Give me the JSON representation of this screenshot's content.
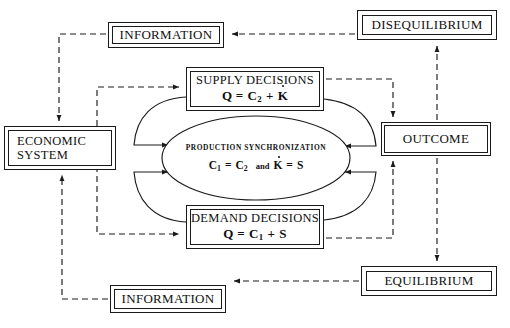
{
  "diagram": {
    "colors": {
      "stroke": "#1a1a1a",
      "text": "#101010",
      "background": "#ffffff"
    },
    "nodes": {
      "information_top": {
        "label": "INFORMATION"
      },
      "disequilibrium": {
        "label": "DISEQUILIBRIUM"
      },
      "economic_system": {
        "label_line1": "ECONOMIC",
        "label_line2": "SYSTEM"
      },
      "supply_decisions": {
        "label": "SUPPLY  DECISIONS",
        "equation_text": "Q = C2 + K̇",
        "equation_lhs": "Q =",
        "equation_c": "C",
        "equation_c_sub": "2",
        "equation_plus": "+",
        "equation_k": "K"
      },
      "demand_decisions": {
        "label": "DEMAND DECISIONS",
        "equation_text": "Q = C1 + S",
        "equation_lhs": "Q =",
        "equation_c": "C",
        "equation_c_sub": "1",
        "equation_plus": "+",
        "equation_s": "S"
      },
      "production_synchronization": {
        "title": "PRODUCTION  SYNCHRONIZATION",
        "equation_text": "C1 = C2  and  K̇ = S",
        "eq_c_a": "C",
        "eq_c_a_sub": "1",
        "eq_equals_1": "=",
        "eq_c_b": "C",
        "eq_c_b_sub": "2",
        "eq_and": "and",
        "eq_k": "K",
        "eq_equals_2": "=",
        "eq_s": "S"
      },
      "outcome": {
        "label": "OUTCOME"
      },
      "equilibrium": {
        "label": "EQUILIBRIUM"
      },
      "information_bottom": {
        "label": "INFORMATION"
      }
    },
    "edges": [
      {
        "name": "disequilibrium-to-information-top",
        "style": "dashed",
        "from": "disequilibrium",
        "to": "information_top"
      },
      {
        "name": "information-top-to-economic-system",
        "style": "dashed",
        "from": "information_top",
        "to": "economic_system"
      },
      {
        "name": "economic-system-to-supply-decisions",
        "style": "dashed",
        "from": "economic_system",
        "to": "supply_decisions"
      },
      {
        "name": "economic-system-to-demand-decisions",
        "style": "dashed",
        "from": "economic_system",
        "to": "demand_decisions"
      },
      {
        "name": "supply-decisions-to-outcome",
        "style": "dashed",
        "from": "supply_decisions",
        "to": "outcome"
      },
      {
        "name": "demand-decisions-to-outcome",
        "style": "dashed",
        "from": "demand_decisions",
        "to": "outcome"
      },
      {
        "name": "outcome-to-disequilibrium",
        "style": "dashed",
        "from": "outcome",
        "to": "disequilibrium"
      },
      {
        "name": "outcome-to-equilibrium",
        "style": "dashed",
        "from": "outcome",
        "to": "equilibrium"
      },
      {
        "name": "equilibrium-to-information-bottom",
        "style": "dashed",
        "from": "equilibrium",
        "to": "information_bottom"
      },
      {
        "name": "information-bottom-to-economic-system",
        "style": "dashed",
        "from": "information_bottom",
        "to": "economic_system"
      },
      {
        "name": "supply-decisions-to-core-left",
        "style": "solid",
        "from": "supply_decisions",
        "to": "production_synchronization"
      },
      {
        "name": "demand-decisions-to-core-left",
        "style": "solid",
        "from": "demand_decisions",
        "to": "production_synchronization"
      },
      {
        "name": "supply-decisions-to-core-right",
        "style": "solid",
        "from": "supply_decisions",
        "to": "production_synchronization"
      },
      {
        "name": "demand-decisions-to-core-right",
        "style": "solid",
        "from": "demand_decisions",
        "to": "production_synchronization"
      }
    ]
  }
}
